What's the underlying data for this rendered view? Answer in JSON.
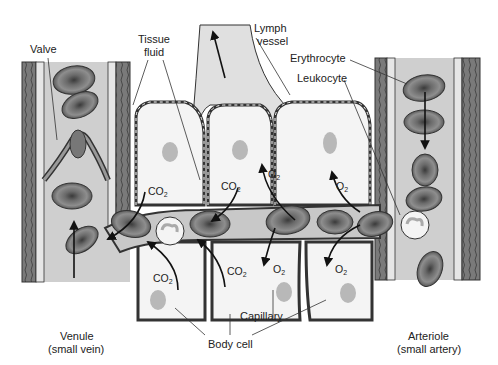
{
  "labels": {
    "valve": "Valve",
    "tissue_fluid_1": "Tissue",
    "tissue_fluid_2": "fluid",
    "lymph_vessel_1": "Lymph",
    "lymph_vessel_2": "vessel",
    "erythrocyte": "Erythrocyte",
    "leukocyte": "Leukocyte",
    "capillary": "Capillary",
    "body_cell": "Body cell",
    "venule_1": "Venule",
    "venule_2": "(small vein)",
    "arteriole_1": "Arteriole",
    "arteriole_2": "(small artery)"
  },
  "gases": {
    "co2_base": "CO",
    "co2_sub": "2",
    "o2_base": "O",
    "o2_sub": "2"
  },
  "colors": {
    "vessel_wall": "#6f6f6f",
    "vessel_wall_dark": "#3a3a3a",
    "plasma": "#cfcfcf",
    "cell_fill": "#f2f2f2",
    "lymph": "#e0e0e0",
    "rbc": "#8a8a8a",
    "nucleus": "#bdbdbd",
    "arrow": "#111111"
  }
}
